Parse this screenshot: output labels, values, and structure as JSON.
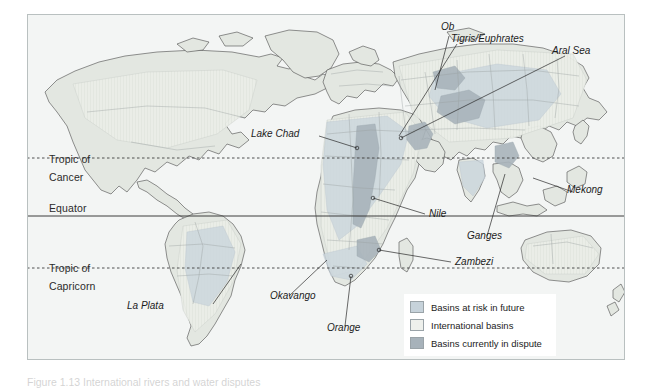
{
  "figure": {
    "caption": "Figure 1.13 International rivers and water disputes"
  },
  "map": {
    "background_color": "#f3f5f4",
    "land_color": "#e2e6e0",
    "outline_color": "#4a4a4a",
    "border_color": "#9aa2a4",
    "latitude_lines": [
      {
        "name": "tropic-of-cancer",
        "label_line1": "Tropic of",
        "label_line2": "Cancer",
        "style": "dotted"
      },
      {
        "name": "equator",
        "label_line1": "Equator",
        "label_line2": "",
        "style": "solid"
      },
      {
        "name": "tropic-of-capricorn",
        "label_line1": "Tropic of",
        "label_line2": "Capricorn",
        "style": "dotted"
      }
    ],
    "features": [
      {
        "label": "Ob"
      },
      {
        "label": "Tigris/Euphrates"
      },
      {
        "label": "Aral Sea"
      },
      {
        "label": "Lake Chad"
      },
      {
        "label": "Mekong"
      },
      {
        "label": "Nile"
      },
      {
        "label": "Ganges"
      },
      {
        "label": "Zambezi"
      },
      {
        "label": "La Plata"
      },
      {
        "label": "Okavango"
      },
      {
        "label": "Orange"
      }
    ]
  },
  "legend": {
    "items": [
      {
        "label": "Basins at risk in future",
        "color": "#c6d2da"
      },
      {
        "label": "International basins",
        "color": "#eef0ec"
      },
      {
        "label": "Basins currently in dispute",
        "color": "#a7b2ba"
      }
    ]
  }
}
